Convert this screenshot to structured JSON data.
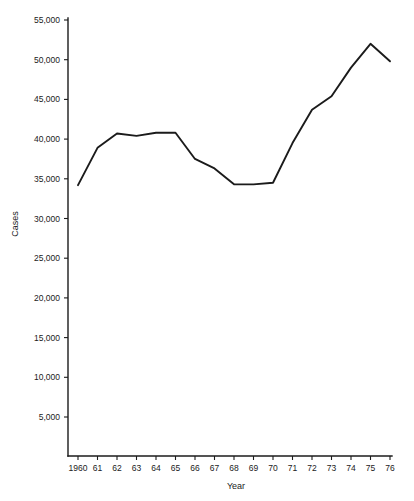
{
  "chart_data": {
    "type": "line",
    "title": "",
    "xlabel": "Year",
    "ylabel": "Cases",
    "x": [
      1960,
      1961,
      1962,
      1963,
      1964,
      1965,
      1966,
      1967,
      1968,
      1969,
      1970,
      1971,
      1972,
      1973,
      1974,
      1975,
      1976
    ],
    "xtick_labels": [
      "1960",
      "61",
      "62",
      "63",
      "64",
      "65",
      "66",
      "67",
      "68",
      "69",
      "70",
      "71",
      "72",
      "73",
      "74",
      "75",
      "76"
    ],
    "values": [
      34200,
      38900,
      40700,
      40400,
      40800,
      40800,
      37500,
      36300,
      34300,
      34300,
      34500,
      39500,
      43700,
      45400,
      49000,
      52000,
      49800
    ],
    "ytick_values": [
      5000,
      10000,
      15000,
      20000,
      25000,
      30000,
      35000,
      40000,
      45000,
      50000,
      55000
    ],
    "ytick_labels": [
      "5,000",
      "10,000",
      "15,000",
      "20,000",
      "25,000",
      "30,000",
      "35,000",
      "40,000",
      "45,000",
      "50,000",
      "55,000"
    ],
    "ylim": [
      0,
      55000
    ],
    "xlim": [
      1960,
      1976
    ],
    "grid": false,
    "legend": null,
    "series_color": "#1b1b1b",
    "background_color": "#ffffff"
  }
}
